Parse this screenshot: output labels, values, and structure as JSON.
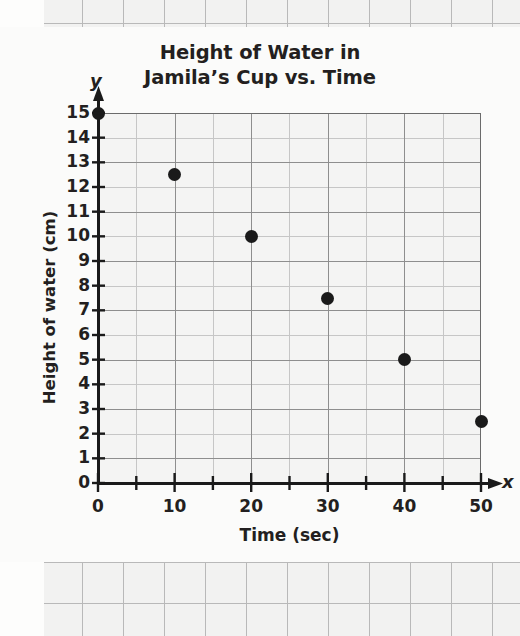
{
  "chart_data": {
    "type": "scatter",
    "title_lines": [
      "Height of Water in",
      "Jamila’s Cup vs. Time"
    ],
    "xlabel": "Time (sec)",
    "ylabel": "Height of water (cm)",
    "x_axis_letter": "x",
    "y_axis_letter": "y",
    "xlim": [
      0,
      50
    ],
    "ylim": [
      0,
      15
    ],
    "x_major_ticks": [
      0,
      10,
      20,
      30,
      40,
      50
    ],
    "x_minor_tick_step": 5,
    "y_major_ticks": [
      0,
      1,
      2,
      3,
      4,
      5,
      6,
      7,
      8,
      9,
      10,
      11,
      12,
      13,
      14,
      15
    ],
    "x_tick_labels": [
      "0",
      "10",
      "20",
      "30",
      "40",
      "50"
    ],
    "y_tick_labels": [
      "0",
      "1",
      "2",
      "3",
      "4",
      "5",
      "6",
      "7",
      "8",
      "9",
      "10",
      "11",
      "12",
      "13",
      "14",
      "15"
    ],
    "grid": true,
    "legend": "none",
    "marker_color": "#1a1a1a",
    "points": [
      {
        "x": 0,
        "y": 15
      },
      {
        "x": 10,
        "y": 12.5
      },
      {
        "x": 20,
        "y": 10
      },
      {
        "x": 30,
        "y": 7.5
      },
      {
        "x": 40,
        "y": 5
      },
      {
        "x": 50,
        "y": 2.5
      }
    ],
    "x": [
      0,
      10,
      20,
      30,
      40,
      50
    ],
    "values": [
      15,
      12.5,
      10,
      7.5,
      5,
      2.5
    ]
  },
  "page": {
    "background_color": "#fbfbfa",
    "grid_paper_color": "#f2f2f1",
    "ink_color": "#231f20"
  }
}
